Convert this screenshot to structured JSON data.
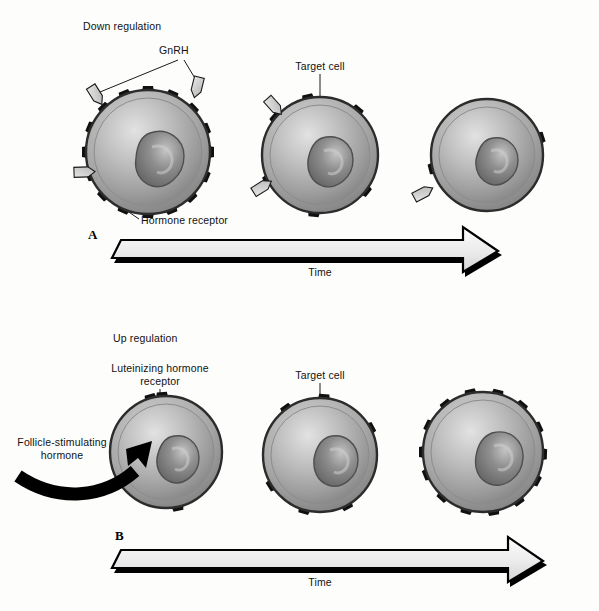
{
  "figure": {
    "background_color": "#fdfdfc",
    "width": 599,
    "height": 611
  },
  "colors": {
    "cell_membrane": "#4a4a4a",
    "cytoplasm_light": "#d8d8d8",
    "cytoplasm_mid": "#a9a9a9",
    "cytoplasm_dark": "#8a8a8a",
    "nucleus_light": "#b9b9b9",
    "nucleus_dark": "#6e6e6e",
    "receptor": "#101010",
    "ligand_fill": "#d2d2d2",
    "ligand_stroke": "#1a1a1a",
    "arrow_fill": "#efefef",
    "arrow_shadow": "#000000",
    "leader_line": "#1a1a1a",
    "text": "#111111"
  },
  "panels": [
    {
      "id": "A",
      "letter": "A",
      "heading": "Down regulation",
      "labels": {
        "ligand": "GnRH",
        "target_cell": "Target cell",
        "receptor": "Hormone receptor"
      },
      "timeline_caption": "Time",
      "cells": [
        {
          "label": "cell-a1",
          "receptor_count": 16,
          "ligand_count": 3,
          "stage": "initial-high-receptor-density"
        },
        {
          "label": "cell-a2",
          "receptor_count": 6,
          "ligand_count": 2,
          "stage": "mid-reduced-receptors"
        },
        {
          "label": "cell-a3",
          "receptor_count": 2,
          "ligand_count": 1,
          "stage": "late-few-receptors"
        }
      ]
    },
    {
      "id": "B",
      "letter": "B",
      "heading": "Up regulation",
      "labels": {
        "receptor": "Luteinizing hormone\nreceptor",
        "receptor_line1": "Luteinizing hormone",
        "receptor_line2": "receptor",
        "target_cell": "Target cell",
        "hormone_line1": "Follicle-stimulating",
        "hormone_line2": "hormone"
      },
      "timeline_caption": "Time",
      "cells": [
        {
          "label": "cell-b1",
          "receptor_count": 3,
          "ligand_count": 0,
          "stage": "initial-few-receptors"
        },
        {
          "label": "cell-b2",
          "receptor_count": 6,
          "ligand_count": 0,
          "stage": "mid-increasing-receptors"
        },
        {
          "label": "cell-b3",
          "receptor_count": 14,
          "ligand_count": 0,
          "stage": "late-high-receptor-density"
        }
      ]
    }
  ]
}
